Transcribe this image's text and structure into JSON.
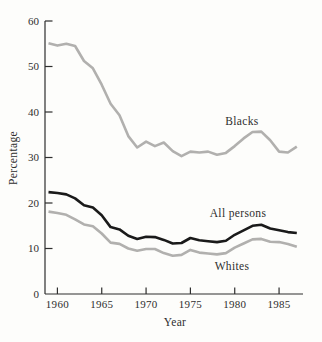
{
  "figure": {
    "background": "#fdfdfb",
    "ink_color": "#2e2e2e"
  },
  "chart_data": {
    "type": "line",
    "title": "",
    "xlabel": "Year",
    "ylabel": "Percentage",
    "x": [
      1959,
      1960,
      1961,
      1962,
      1963,
      1964,
      1965,
      1966,
      1967,
      1968,
      1969,
      1970,
      1971,
      1972,
      1973,
      1974,
      1975,
      1976,
      1977,
      1978,
      1979,
      1980,
      1981,
      1982,
      1983,
      1984,
      1985,
      1986,
      1987
    ],
    "series": [
      {
        "name": "Blacks",
        "color": "#b1b0ae",
        "values": [
          55.1,
          54.6,
          55.0,
          54.5,
          51.2,
          49.6,
          46.0,
          41.8,
          39.3,
          34.7,
          32.2,
          33.5,
          32.5,
          33.3,
          31.4,
          30.3,
          31.3,
          31.1,
          31.3,
          30.6,
          31.0,
          32.5,
          34.2,
          35.6,
          35.7,
          33.8,
          31.3,
          31.1,
          32.4
        ]
      },
      {
        "name": "All persons",
        "color": "#1a1a1a",
        "values": [
          22.4,
          22.2,
          21.9,
          21.0,
          19.5,
          19.0,
          17.3,
          14.7,
          14.2,
          12.8,
          12.1,
          12.6,
          12.5,
          11.9,
          11.1,
          11.2,
          12.3,
          11.8,
          11.6,
          11.4,
          11.7,
          13.0,
          14.0,
          15.0,
          15.2,
          14.4,
          14.0,
          13.6,
          13.4
        ]
      },
      {
        "name": "Whites",
        "color": "#b1b0ae",
        "values": [
          18.1,
          17.8,
          17.4,
          16.4,
          15.3,
          14.9,
          13.3,
          11.3,
          11.0,
          10.0,
          9.5,
          9.9,
          9.9,
          9.0,
          8.4,
          8.6,
          9.7,
          9.1,
          8.9,
          8.7,
          9.0,
          10.2,
          11.1,
          12.0,
          12.1,
          11.5,
          11.4,
          11.0,
          10.4
        ]
      }
    ],
    "xlim": [
      1958.6,
      1987.7
    ],
    "ylim": [
      0,
      60
    ],
    "yticks": [
      0,
      10,
      20,
      30,
      40,
      50,
      60
    ],
    "xticks": [
      1960,
      1965,
      1970,
      1975,
      1980,
      1985
    ],
    "grid": false,
    "legend": "inline-labels"
  }
}
